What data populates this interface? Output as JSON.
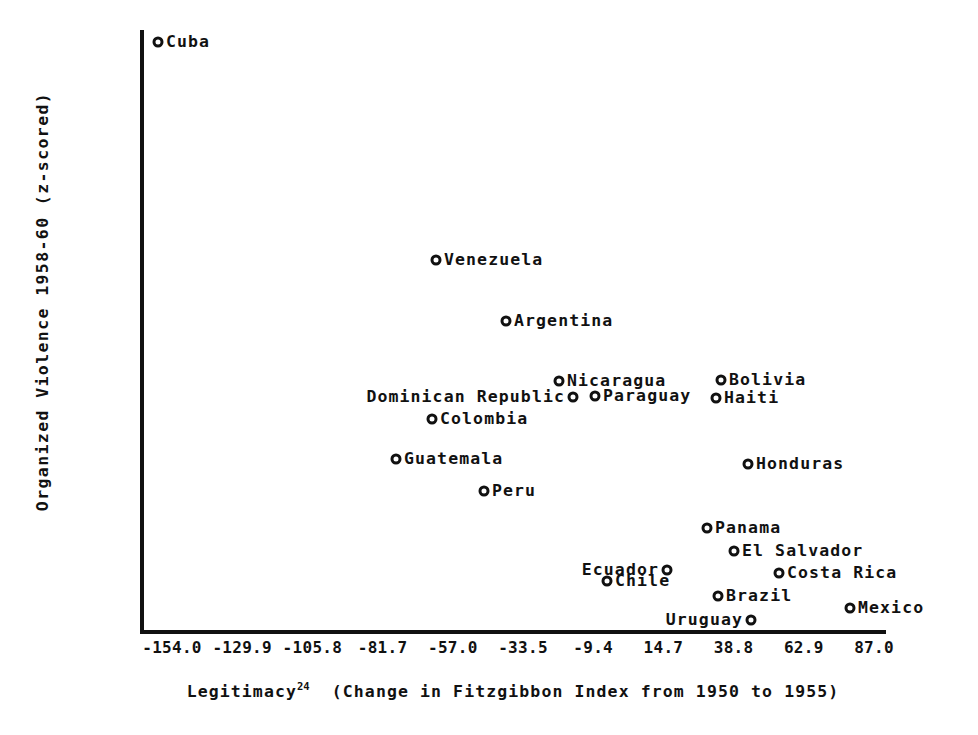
{
  "chart_data": {
    "type": "scatter",
    "title": "",
    "xlabel": "Legitimacy24 (Change in Fitzgibbon Index from 1950 to 1955)",
    "xlabel_main": "Legitimacy",
    "xlabel_superscript": "24",
    "xlabel_rest": "(Change in Fitzgibbon Index from 1950 to 1955)",
    "ylabel": "Organized Violence 1958-60 (z-scored)",
    "grid": false,
    "legend": "none",
    "xticks": [
      "-154.0",
      "-129.9",
      "-105.8",
      "-81.7",
      "-57.0",
      "-33.5",
      "-9.4",
      "14.7",
      "38.8",
      "62.9",
      "87.0"
    ],
    "xtick_values": [
      -154.0,
      -129.9,
      -105.8,
      -81.7,
      -57.0,
      -33.5,
      -9.4,
      14.7,
      38.8,
      62.9,
      87.0
    ],
    "yticks": [
      "2.994",
      "2.828",
      "2.661",
      "2.495",
      "2.328",
      "2.162",
      "1.995",
      "1.829",
      "1.662",
      "1.496",
      "1.330",
      "1.163",
      ".997",
      ".830",
      ".664",
      ".497",
      ".331",
      ".165",
      "-.002",
      "-.168",
      "-.335",
      "-.501",
      "-.668",
      "-.834",
      "-1.001",
      "-1.167"
    ],
    "ytick_values": [
      2.994,
      2.828,
      2.661,
      2.495,
      2.328,
      2.162,
      1.995,
      1.829,
      1.662,
      1.496,
      1.33,
      1.163,
      0.997,
      0.83,
      0.664,
      0.497,
      0.331,
      0.165,
      -0.002,
      -0.168,
      -0.335,
      -0.501,
      -0.668,
      -0.834,
      -1.001,
      -1.167
    ],
    "xlim": [
      -160.2,
      96.2
    ],
    "ylim": [
      -1.167,
      2.994
    ],
    "points": [
      {
        "label": "Cuba",
        "x": -148.0,
        "y": 2.96,
        "label_side": "right",
        "px": 158,
        "py": 42
      },
      {
        "label": "Venezuela",
        "x": -52.0,
        "y": 1.49,
        "label_side": "right",
        "px": 436,
        "py": 260
      },
      {
        "label": "Argentina",
        "x": -30.0,
        "y": 0.99,
        "label_side": "right",
        "px": 506,
        "py": 321
      },
      {
        "label": "Nicaragua",
        "x": -11.5,
        "y": 0.62,
        "label_side": "right",
        "px": 559,
        "py": 381
      },
      {
        "label": "Bolivia",
        "x": 42.0,
        "y": 0.57,
        "label_side": "right",
        "px": 721,
        "py": 380
      },
      {
        "label": "Dominican Republic",
        "x": -7.0,
        "y": 0.37,
        "label_side": "left",
        "px": 573,
        "py": 397
      },
      {
        "label": "Paraguay",
        "x": 0.5,
        "y": 0.38,
        "label_side": "right",
        "px": 595,
        "py": 396
      },
      {
        "label": "Haiti",
        "x": 41.0,
        "y": 0.34,
        "label_side": "right",
        "px": 716,
        "py": 398
      },
      {
        "label": "Colombia",
        "x": -68.0,
        "y": 0.21,
        "label_side": "right",
        "px": 432,
        "py": 419
      },
      {
        "label": "Guatemala",
        "x": -72.0,
        "y": -0.03,
        "label_side": "right",
        "px": 396,
        "py": 459
      },
      {
        "label": "Honduras",
        "x": 50.0,
        "y": -0.02,
        "label_side": "right",
        "px": 748,
        "py": 464
      },
      {
        "label": "Peru",
        "x": -41.0,
        "y": -0.22,
        "label_side": "right",
        "px": 484,
        "py": 491
      },
      {
        "label": "Panama",
        "x": 33.0,
        "y": -0.5,
        "label_side": "right",
        "px": 707,
        "py": 528
      },
      {
        "label": "El Salvador",
        "x": 36.0,
        "y": -0.66,
        "label_side": "right",
        "px": 734,
        "py": 551
      },
      {
        "label": "Ecuador",
        "x": 22.0,
        "y": -0.77,
        "label_side": "left",
        "px": 667,
        "py": 570
      },
      {
        "label": "Costa Rica",
        "x": 55.0,
        "y": -0.8,
        "label_side": "right",
        "px": 779,
        "py": 573
      },
      {
        "label": "Chile",
        "x": 1.0,
        "y": -0.85,
        "label_side": "right",
        "px": 607,
        "py": 581
      },
      {
        "label": "Brazil",
        "x": 20.0,
        "y": -0.94,
        "label_side": "right",
        "px": 718,
        "py": 596
      },
      {
        "label": "Mexico",
        "x": 81.0,
        "y": -1.0,
        "label_side": "right",
        "px": 850,
        "py": 608
      },
      {
        "label": "Uruguay",
        "x": 16.0,
        "y": -1.1,
        "label_side": "left",
        "px": 751,
        "py": 620
      }
    ]
  },
  "colors": {
    "ink": "#111111",
    "background": "#ffffff"
  }
}
